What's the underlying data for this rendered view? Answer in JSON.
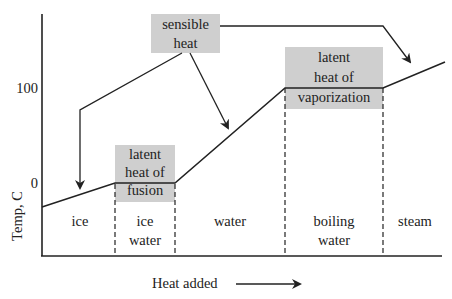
{
  "diagram": {
    "axes": {
      "y_label": "Temp, C",
      "x_label": "Heat added",
      "y_ticks": [
        {
          "label": "100",
          "value": 100
        },
        {
          "label": "0",
          "value": 0
        }
      ]
    },
    "phases": [
      {
        "label": "ice"
      },
      {
        "label_line1": "ice",
        "label_line2": "water"
      },
      {
        "label": "water"
      },
      {
        "label_line1": "boiling",
        "label_line2": "water"
      },
      {
        "label": "steam"
      }
    ],
    "callouts": {
      "sensible": {
        "line1": "sensible",
        "line2": "heat"
      },
      "fusion": {
        "line1": "latent",
        "line2": "heat of",
        "line3": "fusion"
      },
      "vaporization": {
        "line1": "latent",
        "line2": "heat of",
        "line3": "vaporization"
      }
    },
    "colors": {
      "box_fill": "#cfcfcf",
      "line": "#222222",
      "background": "#ffffff"
    }
  }
}
